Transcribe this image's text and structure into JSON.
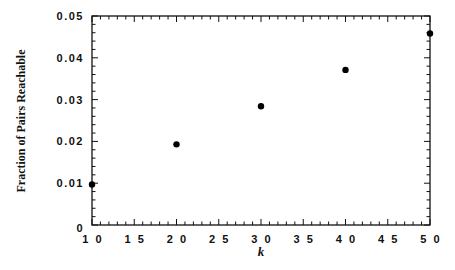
{
  "chart_data": {
    "type": "scatter",
    "title": "",
    "xlabel": "k",
    "ylabel": "Fraction of Pairs Reachable",
    "xlim": [
      10,
      50
    ],
    "ylim": [
      0,
      0.05
    ],
    "x_ticks": [
      10,
      15,
      20,
      25,
      30,
      35,
      40,
      45,
      50
    ],
    "x_tick_labels": [
      "1 0",
      "1 5",
      "2 0",
      "2 5",
      "3 0",
      "3 5",
      "4 0",
      "4 5",
      "5 0"
    ],
    "y_ticks": [
      0,
      0.01,
      0.02,
      0.03,
      0.04,
      0.05
    ],
    "y_tick_labels": [
      "0",
      "0.01",
      "0.02",
      "0.03",
      "0.04",
      "0.05"
    ],
    "grid": false,
    "legend": null,
    "series": [
      {
        "name": "Fraction of Pairs Reachable",
        "x": [
          10,
          20,
          30,
          40,
          50
        ],
        "y": [
          0.0097,
          0.0193,
          0.0284,
          0.0371,
          0.0458
        ],
        "marker": "filled-circle",
        "color": "#000000"
      }
    ]
  }
}
